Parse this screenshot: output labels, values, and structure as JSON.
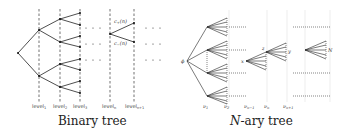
{
  "figure": {
    "panels": [
      {
        "id": "binary",
        "title": "Binary tree",
        "level_labels": [
          "level1",
          "level2",
          "level3",
          "leveln",
          "leveln+1"
        ],
        "level_labels_display": [
          {
            "base": "level",
            "sub": "1"
          },
          {
            "base": "level",
            "sub": "2"
          },
          {
            "base": "level",
            "sub": "3"
          },
          {
            "base": "level",
            "sub": "n"
          },
          {
            "base": "level",
            "sub": "n+1"
          }
        ],
        "node_labels": {
          "upper_child": {
            "base": "c",
            "sub": "+",
            "arg": "(n)"
          },
          "lower_child": {
            "base": "c",
            "sub": "−",
            "arg": "(n)"
          }
        },
        "ellipsis": "· · ·"
      },
      {
        "id": "nary",
        "title_prefix": "N",
        "title_suffix": "-ary tree",
        "root_label": "ϕ",
        "node_labels": {
          "x": "x",
          "z": "z",
          "y": "y",
          "N": "N"
        },
        "level_labels_display": [
          {
            "base": "ν",
            "sub": "1"
          },
          {
            "base": "ν",
            "sub": "2"
          },
          {
            "base": "ν",
            "sub": "n−1"
          },
          {
            "base": "ν",
            "sub": "n"
          },
          {
            "base": "ν",
            "sub": "n+1"
          }
        ]
      }
    ]
  }
}
